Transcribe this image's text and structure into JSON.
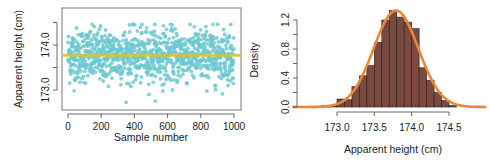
{
  "chart_data": [
    {
      "type": "scatter",
      "title": "",
      "xlabel": "Sample number",
      "ylabel": "Apparent height (cm)",
      "xlim": [
        0,
        1000
      ],
      "ylim": [
        172.7,
        174.55
      ],
      "x_ticks": [
        0,
        200,
        400,
        600,
        800,
        1000
      ],
      "y_ticks": [
        173.0,
        174.0
      ],
      "y_minor_ticks": [
        173.5,
        174.5
      ],
      "point_color": "#6cc9cf",
      "mean_line": {
        "y": 173.77,
        "color": "#d8c23a"
      },
      "n_points": 1000,
      "summary": {
        "mean": 173.77,
        "sd": 0.3,
        "min": 172.72,
        "max": 174.46
      }
    },
    {
      "type": "bar",
      "subtype": "histogram",
      "title": "",
      "xlabel": "Apparent height (cm)",
      "ylabel": "Density",
      "x_ticks": [
        173.0,
        173.5,
        174.0,
        174.5
      ],
      "y_ticks": [
        0.0,
        0.4,
        0.8,
        1.2
      ],
      "ylim": [
        0,
        1.35
      ],
      "bin_width": 0.1,
      "bins": [
        {
          "x0": 172.7,
          "x1": 172.8,
          "density": 0.01
        },
        {
          "x0": 172.8,
          "x1": 172.9,
          "density": 0.02
        },
        {
          "x0": 172.9,
          "x1": 173.0,
          "density": 0.02
        },
        {
          "x0": 173.0,
          "x1": 173.1,
          "density": 0.11
        },
        {
          "x0": 173.1,
          "x1": 173.2,
          "density": 0.1
        },
        {
          "x0": 173.2,
          "x1": 173.3,
          "density": 0.28
        },
        {
          "x0": 173.3,
          "x1": 173.4,
          "density": 0.43
        },
        {
          "x0": 173.4,
          "x1": 173.5,
          "density": 0.57
        },
        {
          "x0": 173.5,
          "x1": 173.6,
          "density": 0.89
        },
        {
          "x0": 173.6,
          "x1": 173.7,
          "density": 1.2
        },
        {
          "x0": 173.7,
          "x1": 173.8,
          "density": 1.33
        },
        {
          "x0": 173.8,
          "x1": 173.9,
          "density": 1.24
        },
        {
          "x0": 173.9,
          "x1": 174.0,
          "density": 1.17
        },
        {
          "x0": 174.0,
          "x1": 174.1,
          "density": 1.08
        },
        {
          "x0": 174.1,
          "x1": 174.2,
          "density": 0.54
        },
        {
          "x0": 174.2,
          "x1": 174.3,
          "density": 0.37
        },
        {
          "x0": 174.3,
          "x1": 174.4,
          "density": 0.2
        },
        {
          "x0": 174.4,
          "x1": 174.5,
          "density": 0.09
        },
        {
          "x0": 174.5,
          "x1": 174.6,
          "density": 0.02
        }
      ],
      "bar_color": "#7a4a40",
      "curve": {
        "type": "normal",
        "mean": 173.79,
        "sd": 0.3,
        "color": "#e8873a"
      }
    }
  ]
}
